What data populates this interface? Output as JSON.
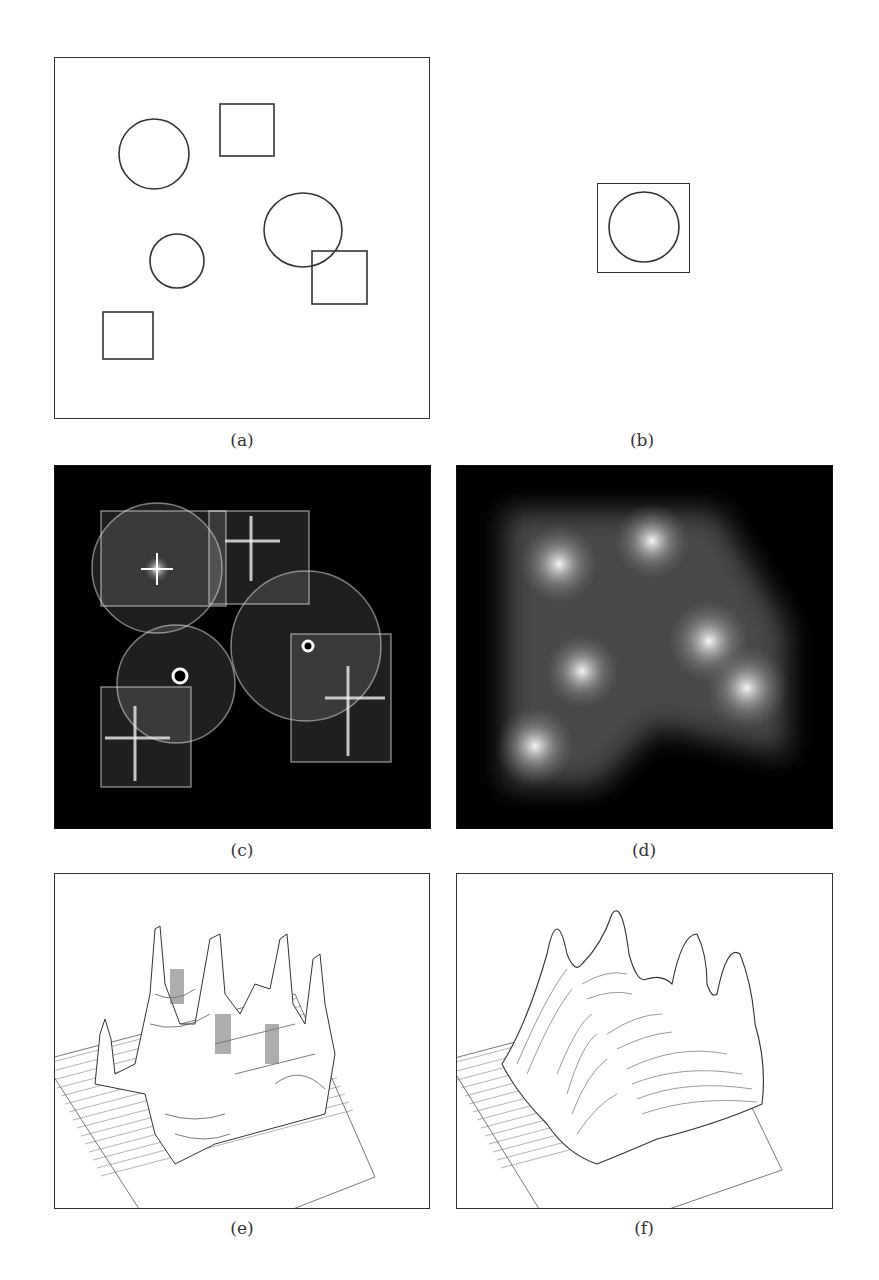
{
  "figure": {
    "panels": [
      {
        "id": "a",
        "caption": "(a)",
        "description": "Binary test image: three circles and three squares outlined on white background"
      },
      {
        "id": "b",
        "caption": "(b)",
        "description": "Template: circle inscribed in a square"
      },
      {
        "id": "c",
        "caption": "(c)",
        "description": "Accumulator / transform image with bright star-like responses at shape centers"
      },
      {
        "id": "d",
        "caption": "(d)",
        "description": "Smoothed intensity map with bright blobs"
      },
      {
        "id": "e",
        "caption": "(e)",
        "description": "3D surface plot of raw response (jagged peaks)"
      },
      {
        "id": "f",
        "caption": "(f)",
        "description": "3D surface plot of smoothed response (smooth peaks)"
      }
    ]
  },
  "colors": {
    "line": "#333333",
    "dark_bg": "#000000",
    "glow": "#ffffff"
  }
}
